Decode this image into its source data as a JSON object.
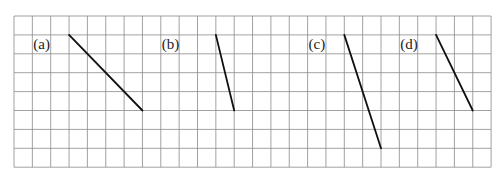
{
  "diagram": {
    "grid": {
      "left": 14,
      "top": 16,
      "cols": 26,
      "rows": 8,
      "cell_w": 18.35,
      "cell_h": 18.9,
      "line_color": "#8a8a8a"
    },
    "segments": [
      {
        "label": "(a)",
        "label_col": 1,
        "from": [
          3,
          1
        ],
        "to": [
          7,
          5
        ]
      },
      {
        "label": "(b)",
        "label_col": 8,
        "from": [
          11,
          1
        ],
        "to": [
          12,
          5
        ]
      },
      {
        "label": "(c)",
        "label_col": 16,
        "from": [
          18,
          1
        ],
        "to": [
          20,
          7
        ]
      },
      {
        "label": "(d)",
        "label_col": 21,
        "from": [
          23,
          1
        ],
        "to": [
          25,
          5
        ]
      }
    ],
    "line_color": "#111111"
  }
}
